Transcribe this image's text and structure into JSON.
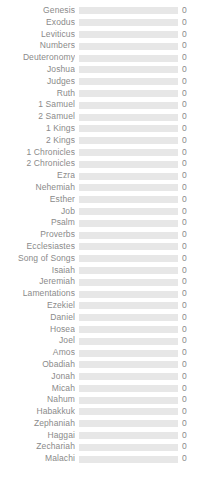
{
  "chart_data": {
    "type": "bar",
    "orientation": "horizontal",
    "title": "",
    "subtitle": "",
    "xlabel": "",
    "ylabel": "",
    "grid": false,
    "legend": null,
    "xlim": [
      0,
      0
    ],
    "value_label_suffix": "",
    "track_color": "#e7e7e7",
    "bar_color": "#7a9ec2",
    "label_color": "#8a8a8a",
    "background": "#ffffff",
    "categories": [
      "Genesis",
      "Exodus",
      "Leviticus",
      "Numbers",
      "Deuteronomy",
      "Joshua",
      "Judges",
      "Ruth",
      "1 Samuel",
      "2 Samuel",
      "1 Kings",
      "2 Kings",
      "1 Chronicles",
      "2 Chronicles",
      "Ezra",
      "Nehemiah",
      "Esther",
      "Job",
      "Psalm",
      "Proverbs",
      "Ecclesiastes",
      "Song of Songs",
      "Isaiah",
      "Jeremiah",
      "Lamentations",
      "Ezekiel",
      "Daniel",
      "Hosea",
      "Joel",
      "Amos",
      "Obadiah",
      "Jonah",
      "Micah",
      "Nahum",
      "Habakkuk",
      "Zephaniah",
      "Haggai",
      "Zechariah",
      "Malachi"
    ],
    "values": [
      0,
      0,
      0,
      0,
      0,
      0,
      0,
      0,
      0,
      0,
      0,
      0,
      0,
      0,
      0,
      0,
      0,
      0,
      0,
      0,
      0,
      0,
      0,
      0,
      0,
      0,
      0,
      0,
      0,
      0,
      0,
      0,
      0,
      0,
      0,
      0,
      0,
      0,
      0
    ],
    "value_labels": [
      "0",
      "0",
      "0",
      "0",
      "0",
      "0",
      "0",
      "0",
      "0",
      "0",
      "0",
      "0",
      "0",
      "0",
      "0",
      "0",
      "0",
      "0",
      "0",
      "0",
      "0",
      "0",
      "0",
      "0",
      "0",
      "0",
      "0",
      "0",
      "0",
      "0",
      "0",
      "0",
      "0",
      "0",
      "0",
      "0",
      "0",
      "0",
      "0"
    ]
  }
}
